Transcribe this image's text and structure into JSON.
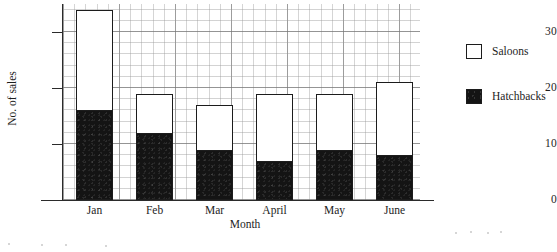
{
  "chart_data": {
    "type": "bar",
    "subtype": "stacked",
    "title": "",
    "xlabel": "Month",
    "ylabel": "No. of sales",
    "categories": [
      "Jan",
      "Feb",
      "Mar",
      "April",
      "May",
      "June"
    ],
    "series": [
      {
        "name": "Hatchbacks",
        "color": "#141414",
        "values": [
          16,
          12,
          9,
          7,
          9,
          8
        ]
      },
      {
        "name": "Saloons",
        "color": "#ffffff",
        "values": [
          18,
          7,
          8,
          12,
          10,
          13
        ]
      }
    ],
    "totals": [
      34,
      19,
      17,
      19,
      19,
      21
    ],
    "ylim": [
      0,
      35
    ],
    "yticks": [
      0,
      10,
      20,
      30
    ],
    "ytick_labels": [
      "0",
      "10",
      "20",
      "30"
    ],
    "grid": "graph-paper, minor every 2 units, major every 10 units",
    "legend_position": "right"
  },
  "legend": {
    "entries": [
      {
        "label": "Saloons",
        "style": "open"
      },
      {
        "label": "Hatchbacks",
        "style": "filled"
      }
    ]
  }
}
